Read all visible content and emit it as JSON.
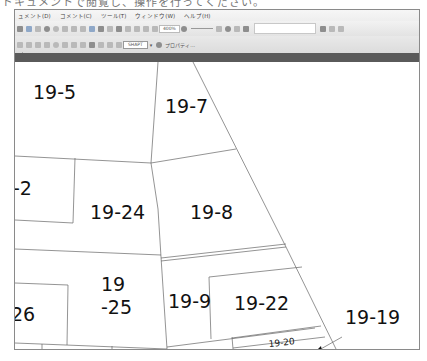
{
  "page_strip": {
    "text": "ドキュメントで閲覧し、操作を行ってください。"
  },
  "menubar": {
    "items": [
      {
        "label": "ュメント(D)"
      },
      {
        "label": "コメント(C)"
      },
      {
        "label": "ツール(T)"
      },
      {
        "label": "ウィンドウ(W)"
      },
      {
        "label": "ヘルプ(H)"
      }
    ]
  },
  "toolbar1": {
    "zoom_level": "400%",
    "search_placeholder": ""
  },
  "toolbar2": {
    "style_box": "SHAPT",
    "properties_label": "プロパティ..."
  },
  "map": {
    "parcels": [
      {
        "id": "19-5",
        "x": 18,
        "y": 37,
        "size": 19
      },
      {
        "id": "19-7",
        "x": 150,
        "y": 51,
        "size": 19
      },
      {
        "id": "-2",
        "x": 0,
        "y": 133,
        "size": 19
      },
      {
        "id": "19-24",
        "x": 75,
        "y": 156,
        "size": 19
      },
      {
        "id": "19-8",
        "x": 175,
        "y": 156,
        "size": 19
      },
      {
        "id": "19",
        "x": 88,
        "y": 228,
        "size": 19
      },
      {
        "id": "-25",
        "x": 88,
        "y": 252,
        "size": 19
      },
      {
        "id": "26",
        "x": -4,
        "y": 259,
        "size": 19
      },
      {
        "id": "19-9",
        "x": 155,
        "y": 246,
        "size": 19
      },
      {
        "id": "19-22",
        "x": 221,
        "y": 248,
        "size": 19
      },
      {
        "id": "19-19",
        "x": 327,
        "y": 262,
        "size": 19
      },
      {
        "id": "19-20",
        "x": 256,
        "y": 288,
        "size": 9
      }
    ]
  }
}
